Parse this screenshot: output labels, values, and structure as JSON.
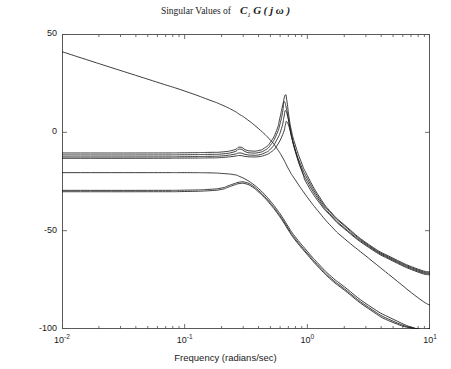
{
  "title": {
    "prefix": "Singular Values of",
    "symbol_c": "C",
    "symbol_c_sub": "1",
    "symbol_g": "G",
    "symbol_arg": "( j ω )"
  },
  "axes": {
    "xlabel": "Frequency (radians/sec)",
    "ylabel": "Magnitude (dB)",
    "xticks": [
      {
        "label_base": "10",
        "label_exp": "-2",
        "value": 0.01
      },
      {
        "label_base": "10",
        "label_exp": "-1",
        "value": 0.1
      },
      {
        "label_base": "10",
        "label_exp": "0",
        "value": 1
      },
      {
        "label_base": "10",
        "label_exp": "1",
        "value": 10
      }
    ],
    "yticks": [
      {
        "label": "50",
        "value": 50
      },
      {
        "label": "0",
        "value": 0
      },
      {
        "label": "-50",
        "value": -50
      },
      {
        "label": "-100",
        "value": -100
      }
    ]
  },
  "chart_data": {
    "type": "line",
    "xlabel": "Frequency (radians/sec)",
    "ylabel": "Magnitude (dB)",
    "xscale": "log",
    "xlim": [
      0.01,
      10
    ],
    "ylim": [
      -100,
      50
    ],
    "grid": false,
    "legend": null,
    "line_color": "#1a1a1a",
    "series": [
      {
        "name": "sigma-1-integrator",
        "x": [
          0.01,
          0.0158,
          0.025,
          0.0398,
          0.0631,
          0.1,
          0.158,
          0.2,
          0.251,
          0.282,
          0.316,
          0.398,
          0.501,
          0.562,
          0.631,
          0.708,
          0.794,
          1.0,
          1.26,
          1.58,
          2.0,
          3.16,
          5.0,
          7.94,
          10.0
        ],
        "y": [
          41.0,
          37.0,
          33.0,
          29.0,
          25.0,
          21.0,
          16.5,
          14.0,
          11.0,
          9.0,
          7.0,
          2.0,
          -4.0,
          -8.0,
          -13.0,
          -19.0,
          -24.0,
          -33.0,
          -41.0,
          -48.0,
          -54.0,
          -64.0,
          -74.0,
          -84.0,
          -88.0
        ]
      },
      {
        "name": "sigma-2-upper-a",
        "x": [
          0.01,
          0.05,
          0.1,
          0.158,
          0.2,
          0.251,
          0.282,
          0.316,
          0.355,
          0.398,
          0.447,
          0.501,
          0.562,
          0.596,
          0.631,
          0.661,
          0.681,
          0.708,
          0.741,
          0.794,
          0.891,
          1.0,
          1.26,
          1.58,
          2.0,
          3.16,
          5.0,
          7.94,
          10.0
        ],
        "y": [
          -10.5,
          -10.5,
          -10.4,
          -10.2,
          -10.0,
          -9.0,
          -7.5,
          -9.0,
          -9.5,
          -9.3,
          -8.0,
          -5.0,
          1.0,
          7.0,
          14.0,
          19.0,
          16.0,
          8.0,
          1.0,
          -6.0,
          -15.0,
          -22.0,
          -33.0,
          -41.0,
          -47.0,
          -57.0,
          -64.0,
          -69.5,
          -71.0
        ]
      },
      {
        "name": "sigma-3-upper-b",
        "x": [
          0.01,
          0.05,
          0.1,
          0.158,
          0.2,
          0.251,
          0.282,
          0.316,
          0.355,
          0.398,
          0.447,
          0.501,
          0.562,
          0.603,
          0.631,
          0.646,
          0.676,
          0.708,
          0.741,
          0.794,
          0.891,
          1.0,
          1.26,
          1.58,
          2.0,
          3.16,
          5.0,
          7.94,
          10.0
        ],
        "y": [
          -11.5,
          -11.5,
          -11.4,
          -11.2,
          -11.0,
          -10.0,
          -8.5,
          -10.0,
          -10.5,
          -10.3,
          -9.2,
          -6.5,
          -1.0,
          5.0,
          11.0,
          15.5,
          12.0,
          5.0,
          -1.5,
          -8.5,
          -17.0,
          -23.5,
          -34.0,
          -41.5,
          -47.5,
          -57.5,
          -64.5,
          -70.0,
          -71.5
        ]
      },
      {
        "name": "sigma-4-upper-c",
        "x": [
          0.01,
          0.05,
          0.1,
          0.158,
          0.2,
          0.251,
          0.282,
          0.316,
          0.355,
          0.398,
          0.447,
          0.501,
          0.562,
          0.616,
          0.646,
          0.661,
          0.692,
          0.724,
          0.759,
          0.813,
          0.891,
          1.0,
          1.26,
          1.58,
          2.0,
          3.16,
          5.0,
          7.94,
          10.0
        ],
        "y": [
          -12.5,
          -12.5,
          -12.4,
          -12.2,
          -12.0,
          -11.2,
          -10.5,
          -11.3,
          -11.6,
          -11.5,
          -10.5,
          -8.5,
          -4.0,
          2.0,
          8.0,
          11.0,
          8.0,
          2.0,
          -4.0,
          -11.0,
          -18.5,
          -25.0,
          -35.0,
          -42.5,
          -48.5,
          -58.0,
          -65.0,
          -70.5,
          -72.0
        ]
      },
      {
        "name": "sigma-5-upper-d",
        "x": [
          0.01,
          0.05,
          0.1,
          0.158,
          0.2,
          0.251,
          0.282,
          0.316,
          0.355,
          0.398,
          0.447,
          0.501,
          0.562,
          0.631,
          0.661,
          0.676,
          0.708,
          0.741,
          0.776,
          0.832,
          0.912,
          1.0,
          1.26,
          1.58,
          2.0,
          3.16,
          5.0,
          7.94,
          10.0
        ],
        "y": [
          -13.2,
          -13.2,
          -13.1,
          -13.0,
          -12.8,
          -12.2,
          -11.8,
          -12.3,
          -12.5,
          -12.4,
          -11.7,
          -10.2,
          -7.0,
          -1.0,
          3.5,
          5.5,
          3.0,
          -2.0,
          -7.0,
          -13.5,
          -20.5,
          -26.5,
          -36.0,
          -43.0,
          -49.0,
          -58.5,
          -65.5,
          -71.0,
          -72.5
        ]
      },
      {
        "name": "sigma-6-lower-a",
        "x": [
          0.01,
          0.05,
          0.1,
          0.158,
          0.2,
          0.251,
          0.282,
          0.316,
          0.355,
          0.398,
          0.447,
          0.501,
          0.562,
          0.631,
          0.708,
          0.794,
          1.0,
          1.26,
          1.58,
          2.0,
          3.16,
          5.0,
          7.94,
          10.0
        ],
        "y": [
          -20.5,
          -20.5,
          -20.5,
          -20.6,
          -20.9,
          -21.5,
          -22.5,
          -24.0,
          -26.0,
          -28.5,
          -31.5,
          -35.0,
          -39.0,
          -43.5,
          -48.5,
          -53.0,
          -60.5,
          -67.5,
          -73.5,
          -78.5,
          -88.0,
          -95.0,
          -100.0,
          -100.0
        ]
      },
      {
        "name": "sigma-7-lower-b",
        "x": [
          0.01,
          0.05,
          0.1,
          0.158,
          0.2,
          0.224,
          0.251,
          0.282,
          0.316,
          0.355,
          0.398,
          0.447,
          0.501,
          0.562,
          0.631,
          0.708,
          0.794,
          1.0,
          1.26,
          1.58,
          2.0,
          3.16,
          5.0,
          7.94,
          10.0
        ],
        "y": [
          -29.5,
          -29.5,
          -29.4,
          -29.0,
          -28.3,
          -27.3,
          -26.2,
          -25.3,
          -25.5,
          -27.0,
          -29.5,
          -32.5,
          -36.0,
          -40.0,
          -44.5,
          -49.5,
          -54.0,
          -61.5,
          -68.5,
          -74.5,
          -79.5,
          -89.0,
          -96.0,
          -100.0,
          -100.0
        ]
      },
      {
        "name": "sigma-8-lower-c",
        "x": [
          0.01,
          0.05,
          0.1,
          0.158,
          0.2,
          0.224,
          0.251,
          0.282,
          0.316,
          0.355,
          0.398,
          0.447,
          0.501,
          0.562,
          0.631,
          0.708,
          0.794,
          1.0,
          1.26,
          1.58,
          2.0,
          3.16,
          5.0,
          7.94,
          10.0
        ],
        "y": [
          -30.2,
          -30.2,
          -30.1,
          -29.7,
          -29.0,
          -28.0,
          -26.9,
          -26.0,
          -26.2,
          -27.7,
          -30.2,
          -33.2,
          -36.7,
          -40.7,
          -45.2,
          -50.2,
          -54.7,
          -62.2,
          -69.2,
          -75.2,
          -80.2,
          -89.7,
          -96.7,
          -100.0,
          -100.0
        ]
      }
    ]
  }
}
